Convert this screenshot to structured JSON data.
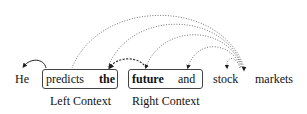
{
  "words": [
    {
      "text": "He",
      "bold": false
    },
    {
      "text": "predicts",
      "bold": false
    },
    {
      "text": "the",
      "bold": true
    },
    {
      "text": "future",
      "bold": true
    },
    {
      "text": "and",
      "bold": false
    },
    {
      "text": "stock",
      "bold": false
    },
    {
      "text": "markets",
      "bold": false
    }
  ],
  "groups": {
    "left_context": {
      "label": "Left Context",
      "words": [
        "predicts",
        "the"
      ]
    },
    "right_context": {
      "label": "Right Context",
      "words": [
        "future",
        "and"
      ]
    }
  },
  "arcs": [
    {
      "from": "predicts",
      "to": "He",
      "style": "solid"
    },
    {
      "from": "future",
      "to": "the",
      "style": "dashed"
    },
    {
      "from": "markets",
      "to": "predicts",
      "style": "dotted"
    },
    {
      "from": "markets",
      "to": "the",
      "style": "dotted"
    },
    {
      "from": "markets",
      "to": "future",
      "style": "dotted"
    },
    {
      "from": "markets",
      "to": "and",
      "style": "dotted"
    },
    {
      "from": "markets",
      "to": "stock",
      "style": "dotted"
    }
  ]
}
